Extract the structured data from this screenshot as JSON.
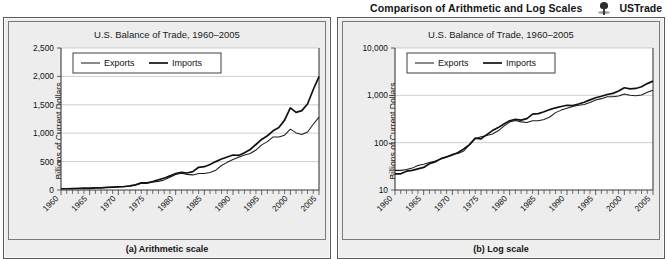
{
  "header": {
    "title": "Comparison of Arithmetic and Log Scales",
    "icon": "pushpin-icon",
    "dataset_name": "USTrade"
  },
  "figures": [
    {
      "caption": "(a) Arithmetic scale",
      "chart_data": {
        "type": "line",
        "scale": "linear",
        "title": "U.S. Balance of Trade, 1960–2005",
        "xlabel": "",
        "ylabel": "Billions of Current Dollars",
        "grid": true,
        "legend_position": "top-left",
        "xlim": [
          1960,
          2005
        ],
        "ylim": [
          0,
          2500
        ],
        "yticks": [
          0,
          500,
          1000,
          1500,
          2000,
          2500
        ],
        "yticklabels": [
          "0",
          "500",
          "1,000",
          "1,500",
          "2,000",
          "2,500"
        ],
        "xticks": [
          1960,
          1965,
          1970,
          1975,
          1980,
          1985,
          1990,
          1995,
          2000,
          2005
        ],
        "xticklabels": [
          "1960",
          "1965",
          "1970",
          "1975",
          "1980",
          "1985",
          "1990",
          "1995",
          "2000",
          "2005"
        ],
        "x": [
          1960,
          1961,
          1962,
          1963,
          1964,
          1965,
          1966,
          1967,
          1968,
          1969,
          1970,
          1971,
          1972,
          1973,
          1974,
          1975,
          1976,
          1977,
          1978,
          1979,
          1980,
          1981,
          1982,
          1983,
          1984,
          1985,
          1986,
          1987,
          1988,
          1989,
          1990,
          1991,
          1992,
          1993,
          1994,
          1995,
          1996,
          1997,
          1998,
          1999,
          2000,
          2001,
          2002,
          2003,
          2004,
          2005
        ],
        "series": [
          {
            "name": "Exports",
            "values": [
              26,
              26,
              27,
              29,
              33,
              35,
              38,
              41,
              45,
              50,
              57,
              59,
              67,
              91,
              121,
              133,
              142,
              152,
              178,
              224,
              272,
              294,
              275,
              266,
              291,
              289,
              310,
              349,
              431,
              487,
              536,
              578,
              617,
              642,
              703,
              794,
              852,
              934,
              933,
              966,
              1071,
              1005,
              977,
              1020,
              1157,
              1283
            ]
          },
          {
            "name": "Imports",
            "values": [
              22,
              22,
              25,
              26,
              28,
              30,
              36,
              39,
              46,
              50,
              55,
              62,
              74,
              91,
              125,
              120,
              148,
              180,
              208,
              248,
              291,
              310,
              299,
              323,
              400,
              410,
              449,
              500,
              545,
              580,
              616,
              609,
              656,
              713,
              801,
              890,
              955,
              1042,
              1099,
              1230,
              1445,
              1367,
              1397,
              1515,
              1769,
              1997
            ]
          }
        ]
      }
    },
    {
      "caption": "(b) Log scale",
      "chart_data": {
        "type": "line",
        "scale": "log",
        "title": "U.S. Balance of Trade, 1960–2005",
        "xlabel": "",
        "ylabel": "Billions of Current Dollars",
        "grid": true,
        "legend_position": "top-left",
        "xlim": [
          1960,
          2005
        ],
        "ylim": [
          10,
          10000
        ],
        "yticks": [
          10,
          100,
          1000,
          10000
        ],
        "yticklabels": [
          "10",
          "100",
          "1,000",
          "10,000"
        ],
        "xticks": [
          1960,
          1965,
          1970,
          1975,
          1980,
          1985,
          1990,
          1995,
          2000,
          2005
        ],
        "xticklabels": [
          "1960",
          "1965",
          "1970",
          "1975",
          "1980",
          "1985",
          "1990",
          "1995",
          "2000",
          "2005"
        ],
        "x": [
          1960,
          1961,
          1962,
          1963,
          1964,
          1965,
          1966,
          1967,
          1968,
          1969,
          1970,
          1971,
          1972,
          1973,
          1974,
          1975,
          1976,
          1977,
          1978,
          1979,
          1980,
          1981,
          1982,
          1983,
          1984,
          1985,
          1986,
          1987,
          1988,
          1989,
          1990,
          1991,
          1992,
          1993,
          1994,
          1995,
          1996,
          1997,
          1998,
          1999,
          2000,
          2001,
          2002,
          2003,
          2004,
          2005
        ],
        "series": [
          {
            "name": "Exports",
            "values": [
              26,
              26,
              27,
              29,
              33,
              35,
              38,
              41,
              45,
              50,
              57,
              59,
              67,
              91,
              121,
              133,
              142,
              152,
              178,
              224,
              272,
              294,
              275,
              266,
              291,
              289,
              310,
              349,
              431,
              487,
              536,
              578,
              617,
              642,
              703,
              794,
              852,
              934,
              933,
              966,
              1071,
              1005,
              977,
              1020,
              1157,
              1283
            ]
          },
          {
            "name": "Imports",
            "values": [
              22,
              22,
              25,
              26,
              28,
              30,
              36,
              39,
              46,
              50,
              55,
              62,
              74,
              91,
              125,
              120,
              148,
              180,
              208,
              248,
              291,
              310,
              299,
              323,
              400,
              410,
              449,
              500,
              545,
              580,
              616,
              609,
              656,
              713,
              801,
              890,
              955,
              1042,
              1099,
              1230,
              1445,
              1367,
              1397,
              1515,
              1769,
              1997
            ]
          }
        ]
      }
    }
  ],
  "legend": {
    "exports_label": "Exports",
    "imports_label": "Imports"
  },
  "colors": {
    "exports_line": "#1c1c1c",
    "imports_line": "#111111",
    "panel_bg": "#eeeeee",
    "plot_bg": "#ffffff",
    "grid": "#b9b9b9"
  }
}
